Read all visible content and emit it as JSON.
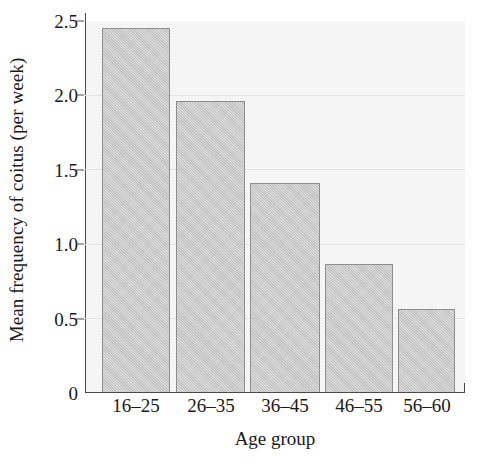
{
  "chart_data": {
    "type": "bar",
    "title": "",
    "xlabel": "Age group",
    "ylabel": "Mean frequency of coitus (per week)",
    "categories": [
      "16–25",
      "26–35",
      "36–45",
      "46–55",
      "56–60"
    ],
    "values": [
      2.45,
      1.96,
      1.41,
      0.86,
      0.56
    ],
    "ylim": [
      0,
      2.5
    ],
    "yticks": [
      "0",
      "0.5",
      "1.0",
      "1.5",
      "2.0",
      "2.5"
    ],
    "ytick_values": [
      0,
      0.5,
      1.0,
      1.5,
      2.0,
      2.5
    ],
    "grid": true,
    "gridlines_at": [
      0.5,
      1.0,
      1.5,
      2.0
    ],
    "legend": null,
    "colors": {
      "bar_fill": "#c9c9c9",
      "bar_edge": "#8e8e8e",
      "plot_background": "#f5f5f5",
      "gridline": "#e4e4e4",
      "axis": "#4a4a4a",
      "text": "#1a1a1a",
      "figure_background": "#ffffff"
    }
  }
}
